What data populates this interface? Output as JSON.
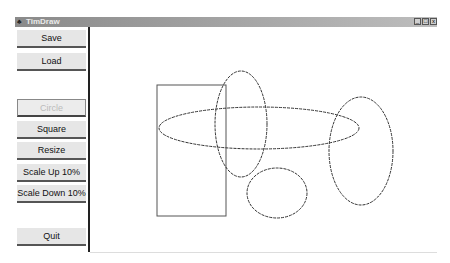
{
  "window": {
    "title": "TimDraw",
    "controls": [
      {
        "name": "minimize",
        "glyph": "_"
      },
      {
        "name": "maximize",
        "glyph": "□"
      },
      {
        "name": "close",
        "glyph": "x"
      }
    ]
  },
  "sidebar": {
    "buttons": [
      {
        "label": "Save",
        "enabled": true
      },
      {
        "label": "Load",
        "enabled": true
      },
      {
        "label": "Circle",
        "enabled": false
      },
      {
        "label": "Square",
        "enabled": true
      },
      {
        "label": "Resize",
        "enabled": true
      },
      {
        "label": "Scale Up 10%",
        "enabled": true
      },
      {
        "label": "Scale Down 10%",
        "enabled": true
      },
      {
        "label": "Quit",
        "enabled": true
      }
    ]
  },
  "canvas": {
    "shapes": [
      {
        "type": "rectangle",
        "x": 157,
        "y": 85,
        "w": 69,
        "h": 131
      },
      {
        "type": "ellipse",
        "cx": 241,
        "cy": 124,
        "rx": 26,
        "ry": 53
      },
      {
        "type": "ellipse",
        "cx": 259,
        "cy": 128,
        "rx": 100,
        "ry": 21
      },
      {
        "type": "ellipse",
        "cx": 361,
        "cy": 151,
        "rx": 32,
        "ry": 54
      },
      {
        "type": "ellipse",
        "cx": 277,
        "cy": 193,
        "rx": 30,
        "ry": 25
      }
    ]
  }
}
